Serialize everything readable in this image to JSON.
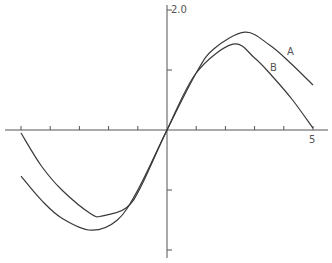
{
  "chart_data": {
    "type": "line",
    "title": "",
    "xlabel": "",
    "ylabel": "",
    "xlim": [
      -5,
      5
    ],
    "ylim": [
      -2.0,
      2.0
    ],
    "x_ticks": [
      -5,
      -4,
      -3,
      -2,
      -1,
      0,
      1,
      2,
      3,
      4,
      5
    ],
    "y_ticks": [
      -2.0,
      -1.0,
      0,
      1.0,
      2.0
    ],
    "tick_labels": {
      "x_max": "5",
      "y_max": "2.0"
    },
    "grid": false,
    "legend": "inline labels",
    "series": [
      {
        "name": "A",
        "x": [
          -5,
          -4.3,
          -3.6,
          -2.6,
          -1.7,
          -1.0,
          0,
          1.0,
          1.6,
          2.67,
          3.5,
          4.2,
          5
        ],
        "y": [
          -0.77,
          -1.17,
          -1.47,
          -1.67,
          -1.5,
          -1.0,
          0,
          0.95,
          1.35,
          1.63,
          1.42,
          1.13,
          0.75
        ]
      },
      {
        "name": "B",
        "x": [
          -5,
          -4.3,
          -3.6,
          -2.6,
          -2.2,
          -1.4,
          -0.9,
          0,
          1.0,
          2.26,
          3.0,
          3.6,
          4.3,
          5
        ],
        "y": [
          -0.05,
          -0.6,
          -1.0,
          -1.4,
          -1.43,
          -1.3,
          -0.95,
          0,
          0.95,
          1.43,
          1.2,
          0.9,
          0.5,
          0.03
        ]
      }
    ]
  },
  "labels": {
    "y_top": "2.0",
    "x_right": "5",
    "curve_a": "A",
    "curve_b": "B"
  },
  "colors": {
    "line": "#3a3a3a",
    "axis": "#555555"
  }
}
